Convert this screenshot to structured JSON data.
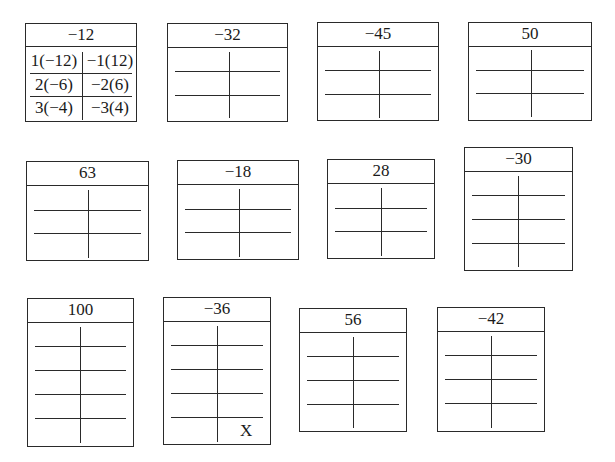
{
  "worksheet": {
    "title": "Factor pair T-tables",
    "boxes": [
      {
        "id": "box-neg12",
        "number": "−12",
        "rows": [
          {
            "left": "1(−12)",
            "right": "−1(12)"
          },
          {
            "left": "2(−6)",
            "right": "−2(6)"
          },
          {
            "left": "3(−4)",
            "right": "−3(4)"
          }
        ]
      },
      {
        "id": "box-neg32",
        "number": "−32",
        "rows": 3
      },
      {
        "id": "box-neg45",
        "number": "−45",
        "rows": 3
      },
      {
        "id": "box-50",
        "number": "50",
        "rows": 3
      },
      {
        "id": "box-63",
        "number": "63",
        "rows": 3
      },
      {
        "id": "box-neg18",
        "number": "−18",
        "rows": 3
      },
      {
        "id": "box-28",
        "number": "28",
        "rows": 3
      },
      {
        "id": "box-neg30",
        "number": "−30",
        "rows": 4
      },
      {
        "id": "box-100",
        "number": "100",
        "rows": 5
      },
      {
        "id": "box-neg36",
        "number": "−36",
        "rows": 5,
        "mark": "X"
      },
      {
        "id": "box-56",
        "number": "56",
        "rows": 4
      },
      {
        "id": "box-neg42",
        "number": "−42",
        "rows": 4
      }
    ]
  },
  "colors": {
    "line": "#2a2a2a",
    "text": "#1a1a1a",
    "background": "#ffffff"
  }
}
